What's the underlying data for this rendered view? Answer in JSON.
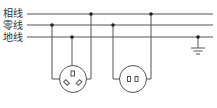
{
  "labels": {
    "live": "相线",
    "neutral": "零线",
    "earth": "地线"
  },
  "colors": {
    "line": "#555555",
    "background": "#ffffff"
  }
}
